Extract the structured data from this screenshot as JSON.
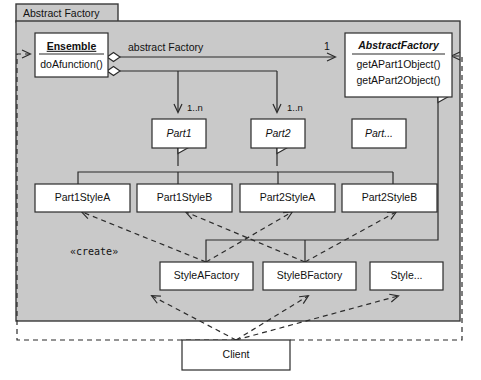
{
  "diagram": {
    "type": "uml-class-diagram",
    "package": {
      "name": "Abstract Factory"
    },
    "classes": [
      {
        "id": "ensemble",
        "name": "Ensemble",
        "style": "bold-underline",
        "abstract": false,
        "members": [
          "doAfunction()"
        ]
      },
      {
        "id": "abstractfactory",
        "name": "AbstractFactory",
        "style": "bold-italic",
        "abstract": true,
        "members": [
          "getAPart1Object()",
          "getAPart2Object()"
        ]
      },
      {
        "id": "part1",
        "name": "Part1",
        "style": "italic",
        "abstract": true,
        "members": []
      },
      {
        "id": "part2",
        "name": "Part2",
        "style": "italic",
        "abstract": true,
        "members": []
      },
      {
        "id": "partmore",
        "name": "Part...",
        "style": "italic",
        "abstract": true,
        "members": []
      },
      {
        "id": "part1stylea",
        "name": "Part1StyleA",
        "style": "plain",
        "abstract": false,
        "members": []
      },
      {
        "id": "part1styleb",
        "name": "Part1StyleB",
        "style": "plain",
        "abstract": false,
        "members": []
      },
      {
        "id": "part2stylea",
        "name": "Part2StyleA",
        "style": "plain",
        "abstract": false,
        "members": []
      },
      {
        "id": "part2styleb",
        "name": "Part2StyleB",
        "style": "plain",
        "abstract": false,
        "members": []
      },
      {
        "id": "styleafactory",
        "name": "StyleAFactory",
        "style": "plain",
        "abstract": false,
        "members": []
      },
      {
        "id": "stylebfactory",
        "name": "StyleBFactory",
        "style": "plain",
        "abstract": false,
        "members": []
      },
      {
        "id": "stylemore",
        "name": "Style...",
        "style": "plain",
        "abstract": false,
        "members": []
      },
      {
        "id": "client",
        "name": "Client",
        "style": "plain",
        "abstract": false,
        "members": []
      }
    ],
    "edge_labels": {
      "association_role": "abstract Factory",
      "multiplicity_one": "1",
      "multiplicity_part1": "1..n",
      "multiplicity_part2": "1..n",
      "stereotype_create": "«create»"
    },
    "colors": {
      "package_fill": "#c9c9c9",
      "class_fill": "#ffffff",
      "line": "#2b2b2b",
      "page_background": "#ffffff"
    }
  }
}
